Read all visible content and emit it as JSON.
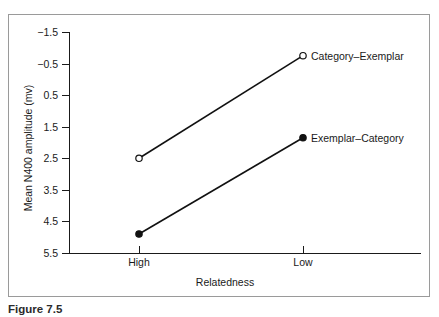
{
  "figure": {
    "caption": "Figure 7.5",
    "background_color": "#ffffff",
    "border_color": "#9a9a9a",
    "ink_color": "#1a1a1a"
  },
  "chart_data": {
    "type": "line",
    "title": "",
    "subtitle": "",
    "xlabel": "Relatedness",
    "ylabel": "Mean N400 amplitude (mv)",
    "categories": [
      "High",
      "Low"
    ],
    "xtick_labels": [
      "High",
      "Low"
    ],
    "ytick_labels": [
      "−1.5",
      "−0.5",
      "0.5",
      "1.5",
      "2.5",
      "3.5",
      "4.5",
      "5.5"
    ],
    "yticks": [
      -1.5,
      -0.5,
      0.5,
      1.5,
      2.5,
      3.5,
      4.5,
      5.5
    ],
    "ylim": [
      -1.5,
      5.5
    ],
    "y_axis_inverted": true,
    "grid": false,
    "legend_position": "inline-right-of-endpoint",
    "series": [
      {
        "name": "Category–Exemplar",
        "values": [
          2.5,
          -0.75
        ],
        "marker": "open-circle",
        "marker_fill": "#ffffff",
        "line_color": "#111111",
        "annotation": "Category–Exemplar"
      },
      {
        "name": "Exemplar–Category",
        "values": [
          4.9,
          1.85
        ],
        "marker": "filled-circle",
        "marker_fill": "#111111",
        "line_color": "#111111",
        "annotation": "Exemplar–Category"
      }
    ]
  }
}
